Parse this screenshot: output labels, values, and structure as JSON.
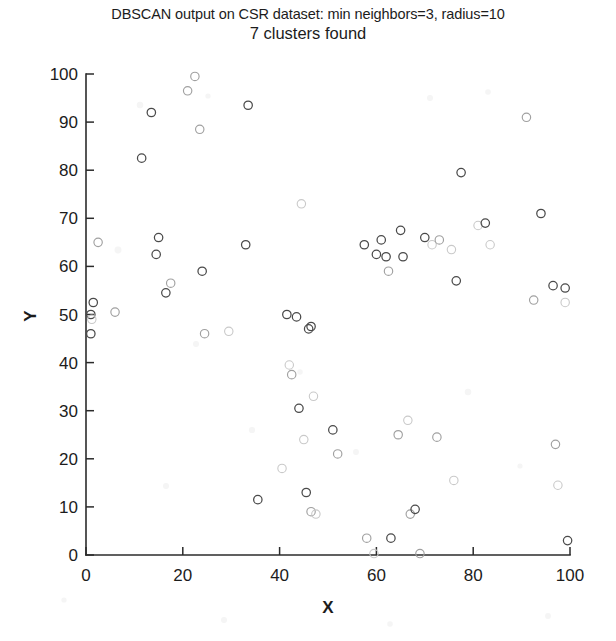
{
  "figure": {
    "title_line1": "DBSCAN output on CSR dataset: min neighbors=3, radius=10",
    "title_line2": "7 clusters found",
    "background_color": "#ffffff",
    "marker_color": "#4a4a4a",
    "axis_color": "#2b2b2b"
  },
  "axes": {
    "x_label": "X",
    "y_label": "Y",
    "x_ticks": [
      "0",
      "20",
      "40",
      "60",
      "80",
      "100"
    ],
    "y_ticks": [
      "0",
      "10",
      "20",
      "30",
      "40",
      "50",
      "60",
      "70",
      "80",
      "90",
      "100"
    ]
  },
  "chart_data": {
    "type": "scatter",
    "title": "DBSCAN output on CSR dataset: min neighbors=3, radius=10\n7 clusters found",
    "xlabel": "X",
    "ylabel": "Y",
    "xlim": [
      0,
      100
    ],
    "ylim": [
      0,
      100
    ],
    "xticks": [
      0,
      20,
      40,
      60,
      80,
      100
    ],
    "yticks": [
      0,
      10,
      20,
      30,
      40,
      50,
      60,
      70,
      80,
      90,
      100
    ],
    "grid": false,
    "legend": "none",
    "marker": "circle-open",
    "annotations": [
      "7 clusters found"
    ],
    "points": [
      [
        1.5,
        52.5
      ],
      [
        1.0,
        50.0
      ],
      [
        1.2,
        49.0
      ],
      [
        1.0,
        46.0
      ],
      [
        2.5,
        65.0
      ],
      [
        6.0,
        50.5
      ],
      [
        11.5,
        82.5
      ],
      [
        13.5,
        92.0
      ],
      [
        14.5,
        62.5
      ],
      [
        15.0,
        66.0
      ],
      [
        16.5,
        54.5
      ],
      [
        17.5,
        56.5
      ],
      [
        21.0,
        96.5
      ],
      [
        22.5,
        99.5
      ],
      [
        23.5,
        88.5
      ],
      [
        24.0,
        59.0
      ],
      [
        24.5,
        46.0
      ],
      [
        29.5,
        46.5
      ],
      [
        33.0,
        64.5
      ],
      [
        33.5,
        93.5
      ],
      [
        35.5,
        11.5
      ],
      [
        40.5,
        18.0
      ],
      [
        41.5,
        50.0
      ],
      [
        42.0,
        39.5
      ],
      [
        42.5,
        37.5
      ],
      [
        43.5,
        49.5
      ],
      [
        44.0,
        30.5
      ],
      [
        44.5,
        73.0
      ],
      [
        45.0,
        24.0
      ],
      [
        45.5,
        13.0
      ],
      [
        46.0,
        47.0
      ],
      [
        46.5,
        47.5
      ],
      [
        46.5,
        9.0
      ],
      [
        47.0,
        33.0
      ],
      [
        47.5,
        8.5
      ],
      [
        51.0,
        26.0
      ],
      [
        52.0,
        21.0
      ],
      [
        57.5,
        64.5
      ],
      [
        58.0,
        3.5
      ],
      [
        59.5,
        0.3
      ],
      [
        60.0,
        62.5
      ],
      [
        61.0,
        65.5
      ],
      [
        62.0,
        62.0
      ],
      [
        62.5,
        59.0
      ],
      [
        63.0,
        3.5
      ],
      [
        64.5,
        25.0
      ],
      [
        65.0,
        67.5
      ],
      [
        65.5,
        62.0
      ],
      [
        66.5,
        28.0
      ],
      [
        67.0,
        8.5
      ],
      [
        68.0,
        9.5
      ],
      [
        69.0,
        0.3
      ],
      [
        70.0,
        66.0
      ],
      [
        71.5,
        64.5
      ],
      [
        72.5,
        24.5
      ],
      [
        73.0,
        65.5
      ],
      [
        75.5,
        63.5
      ],
      [
        76.0,
        15.5
      ],
      [
        76.5,
        57.0
      ],
      [
        77.5,
        79.5
      ],
      [
        81.0,
        68.5
      ],
      [
        82.5,
        69.0
      ],
      [
        83.5,
        64.5
      ],
      [
        91.0,
        91.0
      ],
      [
        92.5,
        53.0
      ],
      [
        94.0,
        71.0
      ],
      [
        96.5,
        56.0
      ],
      [
        97.0,
        23.0
      ],
      [
        97.5,
        14.5
      ],
      [
        99.0,
        55.5
      ],
      [
        99.0,
        52.5
      ],
      [
        99.5,
        3.0
      ]
    ],
    "n_points": 72,
    "clusters_found": 7
  }
}
